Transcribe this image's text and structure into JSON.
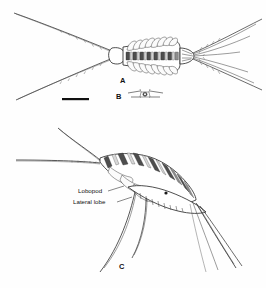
{
  "figure": {
    "background_color": "#fefefe",
    "ink_color": "#222222",
    "panels": [
      {
        "id": "A",
        "label": "A",
        "view": "dorsal",
        "description": "Dorsal view of segmented crustacean body with paired long antennae extending to the left and caudal setae fanning to the right",
        "label_x": 123,
        "label_y": 80
      },
      {
        "id": "B",
        "label": "B",
        "view": "detail-inset",
        "description": "Small dorsal detail of a single segment with lateral extensions",
        "label_x": 119,
        "label_y": 101
      },
      {
        "id": "C",
        "label": "C",
        "view": "lateral",
        "description": "Lateral view of the same animal showing banded trunk segments, lobopods, lateral lobes and trailing setae",
        "label_x": 122,
        "label_y": 266
      }
    ],
    "annotations": [
      {
        "text": "Lobopod",
        "x": 78,
        "y": 193,
        "leader_to_x": 124,
        "leader_to_y": 186
      },
      {
        "text": "Lateral lobe",
        "x": 78,
        "y": 204,
        "leader_to_x": 130,
        "leader_to_y": 199
      }
    ],
    "scale_bar": {
      "x": 62,
      "y": 99,
      "width": 27,
      "height": 2,
      "label": ""
    }
  }
}
